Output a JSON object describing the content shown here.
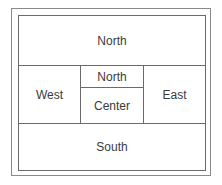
{
  "diagram": {
    "type": "border-layout",
    "regions": {
      "north": "North",
      "west": "West",
      "center_north": "North",
      "center": "Center",
      "east": "East",
      "south": "South"
    }
  }
}
